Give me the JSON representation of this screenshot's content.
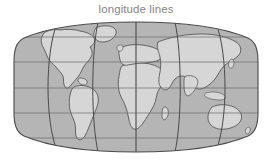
{
  "figure": {
    "title": "longitude lines",
    "title_color": "#868686",
    "background_color": "#ffffff"
  },
  "map": {
    "name": "world-map",
    "projection": "elliptical-pseudocylindrical",
    "ocean_color": "#b5b5b5",
    "land_color": "#d6d6d6",
    "coastline_color": "#4a4a4a",
    "graticule_color": "#5a5a5a",
    "outline_color": "#4a4a4a",
    "bounds": {
      "left": 13,
      "top": 22,
      "right": 258,
      "bottom": 152
    },
    "graticule": {
      "meridian_count": 7,
      "meridian_spacing_px": 40,
      "meridian_labels": [
        "-180",
        "-120",
        "-60",
        "0",
        "60",
        "120",
        "180"
      ],
      "parallel_count": 5,
      "parallel_labels": [
        "60N",
        "30N",
        "0",
        "30S",
        "60S"
      ],
      "parallel_y": [
        37,
        62,
        88,
        113,
        138
      ],
      "prime_meridian_x": 136,
      "equator_y": 88
    },
    "landmasses": [
      "north-america",
      "greenland",
      "south-america",
      "africa",
      "europe",
      "asia",
      "australia",
      "antarctica-rim",
      "japan",
      "indonesia",
      "madagascar",
      "new-zealand",
      "british-isles"
    ]
  }
}
